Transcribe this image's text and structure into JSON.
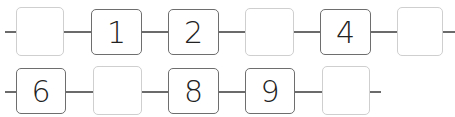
{
  "rows": [
    {
      "cells": [
        {
          "value": "",
          "kind": "empty"
        },
        {
          "value": "1",
          "kind": "given"
        },
        {
          "value": "2",
          "kind": "given"
        },
        {
          "value": "",
          "kind": "empty"
        },
        {
          "value": "4",
          "kind": "given"
        },
        {
          "value": "",
          "kind": "empty"
        }
      ]
    },
    {
      "cells": [
        {
          "value": "6",
          "kind": "given"
        },
        {
          "value": "",
          "kind": "empty"
        },
        {
          "value": "8",
          "kind": "given"
        },
        {
          "value": "9",
          "kind": "given"
        },
        {
          "value": "",
          "kind": "empty"
        }
      ]
    }
  ],
  "colors": {
    "given_border": "#6e6e6e",
    "empty_border": "#cfcfcf",
    "line": "#6b6b6b"
  }
}
